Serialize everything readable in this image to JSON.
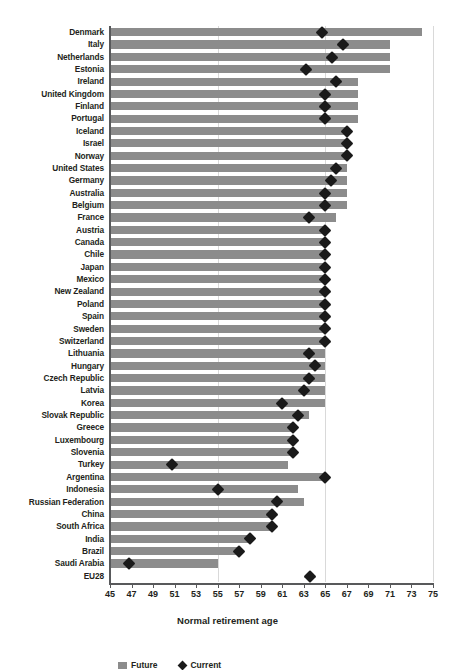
{
  "chart_data": {
    "type": "bar",
    "title": "",
    "xlabel": "Normal retirement age",
    "ylabel": "",
    "xlim": [
      45,
      75
    ],
    "xticks": [
      45,
      47,
      49,
      51,
      53,
      55,
      57,
      59,
      61,
      63,
      65,
      67,
      69,
      71,
      73,
      75
    ],
    "gridlines": [
      55,
      65,
      75
    ],
    "grid": true,
    "orientation": "horizontal",
    "legend_position": "bottom",
    "colors": {
      "bar": "#8c8c8c",
      "marker": "#1a1a1a",
      "axis": "#58595b",
      "grid": "#d9d9d9",
      "text": "#231f20"
    },
    "series": [
      {
        "name": "Future",
        "type": "bar",
        "marker": "square",
        "color": "#8c8c8c"
      },
      {
        "name": "Current",
        "type": "point",
        "marker": "diamond",
        "color": "#1a1a1a"
      }
    ],
    "categories": [
      "Denmark",
      "Italy",
      "Netherlands",
      "Estonia",
      "Ireland",
      "United Kingdom",
      "Finland",
      "Portugal",
      "Iceland",
      "Israel",
      "Norway",
      "United States",
      "Germany",
      "Australia",
      "Belgium",
      "France",
      "Austria",
      "Canada",
      "Chile",
      "Japan",
      "Mexico",
      "New Zealand",
      "Poland",
      "Spain",
      "Sweden",
      "Switzerland",
      "Lithuania",
      "Hungary",
      "Czech Republic",
      "Latvia",
      "Korea",
      "Slovak Republic",
      "Greece",
      "Luxembourg",
      "Slovenia",
      "Turkey",
      "Argentina",
      "Indonesia",
      "Russian Federation",
      "China",
      "South Africa",
      "India",
      "Brazil",
      "Saudi Arabia",
      "EU28"
    ],
    "rows": [
      {
        "category": "Denmark",
        "bar": 74.0,
        "marker": 64.7
      },
      {
        "category": "Italy",
        "bar": 71.0,
        "marker": 66.6
      },
      {
        "category": "Netherlands",
        "bar": 71.0,
        "marker": 65.6
      },
      {
        "category": "Estonia",
        "bar": 71.0,
        "marker": 63.2
      },
      {
        "category": "Ireland",
        "bar": 68.0,
        "marker": 66.0
      },
      {
        "category": "United Kingdom",
        "bar": 68.0,
        "marker": 65.0
      },
      {
        "category": "Finland",
        "bar": 68.0,
        "marker": 65.0
      },
      {
        "category": "Portugal",
        "bar": 68.0,
        "marker": 65.0
      },
      {
        "category": "Iceland",
        "bar": 67.0,
        "marker": 67.0
      },
      {
        "category": "Israel",
        "bar": 67.0,
        "marker": 67.0
      },
      {
        "category": "Norway",
        "bar": 67.0,
        "marker": 67.0
      },
      {
        "category": "United States",
        "bar": 67.0,
        "marker": 66.0
      },
      {
        "category": "Germany",
        "bar": 67.0,
        "marker": 65.5
      },
      {
        "category": "Australia",
        "bar": 67.0,
        "marker": 65.0
      },
      {
        "category": "Belgium",
        "bar": 67.0,
        "marker": 65.0
      },
      {
        "category": "France",
        "bar": 66.0,
        "marker": 63.5
      },
      {
        "category": "Austria",
        "bar": 65.0,
        "marker": 65.0
      },
      {
        "category": "Canada",
        "bar": 65.0,
        "marker": 65.0
      },
      {
        "category": "Chile",
        "bar": 65.0,
        "marker": 65.0
      },
      {
        "category": "Japan",
        "bar": 65.0,
        "marker": 65.0
      },
      {
        "category": "Mexico",
        "bar": 65.0,
        "marker": 65.0
      },
      {
        "category": "New Zealand",
        "bar": 65.0,
        "marker": 65.0
      },
      {
        "category": "Poland",
        "bar": 65.0,
        "marker": 65.0
      },
      {
        "category": "Spain",
        "bar": 65.0,
        "marker": 65.0
      },
      {
        "category": "Sweden",
        "bar": 65.0,
        "marker": 65.0
      },
      {
        "category": "Switzerland",
        "bar": 65.0,
        "marker": 65.0
      },
      {
        "category": "Lithuania",
        "bar": 65.0,
        "marker": 63.5
      },
      {
        "category": "Hungary",
        "bar": 65.0,
        "marker": 64.0
      },
      {
        "category": "Czech Republic",
        "bar": 65.0,
        "marker": 63.5
      },
      {
        "category": "Latvia",
        "bar": 65.0,
        "marker": 63.0
      },
      {
        "category": "Korea",
        "bar": 65.0,
        "marker": 61.0
      },
      {
        "category": "Slovak Republic",
        "bar": 63.5,
        "marker": 62.5
      },
      {
        "category": "Greece",
        "bar": 62.0,
        "marker": 62.0
      },
      {
        "category": "Luxembourg",
        "bar": 62.0,
        "marker": 62.0
      },
      {
        "category": "Slovenia",
        "bar": 62.0,
        "marker": 62.0
      },
      {
        "category": "Turkey",
        "bar": 61.5,
        "marker": 50.8
      },
      {
        "category": "Argentina",
        "bar": 65.0,
        "marker": 65.0
      },
      {
        "category": "Indonesia",
        "bar": 62.5,
        "marker": 55.0
      },
      {
        "category": "Russian Federation",
        "bar": 63.0,
        "marker": 60.5
      },
      {
        "category": "China",
        "bar": 60.0,
        "marker": 60.0
      },
      {
        "category": "South Africa",
        "bar": 60.0,
        "marker": 60.0
      },
      {
        "category": "India",
        "bar": 58.0,
        "marker": 58.0
      },
      {
        "category": "Brazil",
        "bar": 57.0,
        "marker": 57.0
      },
      {
        "category": "Saudi Arabia",
        "bar": 55.0,
        "marker": 46.8
      },
      {
        "category": "EU28",
        "bar": null,
        "marker": 63.6
      }
    ]
  },
  "legend": {
    "items": [
      {
        "label": "Future",
        "marker": "square"
      },
      {
        "label": "Current",
        "marker": "diamond"
      }
    ]
  }
}
